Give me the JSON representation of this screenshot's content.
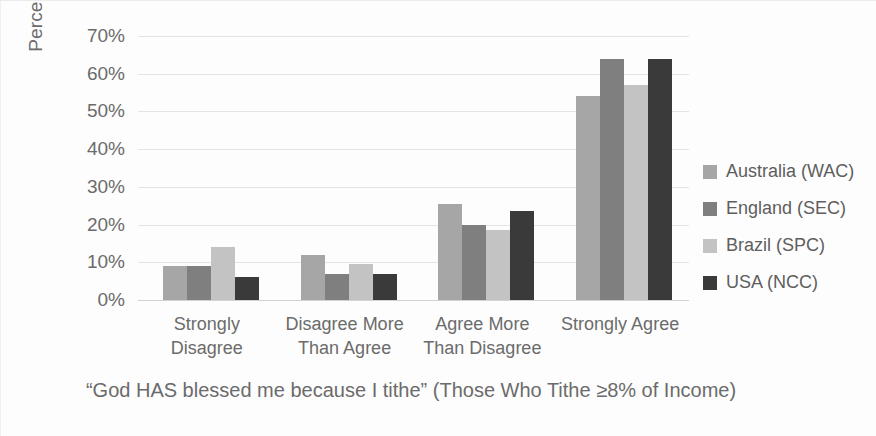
{
  "chart_data": {
    "type": "bar",
    "title": "“God HAS blessed me because I tithe” (Those Who Tithe ≥8% of Income)",
    "xlabel": "",
    "ylabel": "Percent of Respodents",
    "categories": [
      "Strongly\nDisagree",
      "Disagree More\nThan Agree",
      "Agree More\nThan Disagree",
      "Strongly Agree"
    ],
    "series": [
      {
        "name": "Australia (WAC)",
        "color": "#a6a6a6",
        "values": [
          9,
          12,
          25.5,
          54
        ]
      },
      {
        "name": "England (SEC)",
        "color": "#7f7f7f",
        "values": [
          9,
          7,
          20,
          64
        ]
      },
      {
        "name": "Brazil (SPC)",
        "color": "#c3c3c3",
        "values": [
          14,
          9.5,
          18.5,
          57
        ]
      },
      {
        "name": "USA (NCC)",
        "color": "#3a3a3a",
        "values": [
          6,
          7,
          23.5,
          64
        ]
      }
    ],
    "ylim": [
      0,
      70
    ],
    "ytick_labels": [
      "70%",
      "60%",
      "50%",
      "40%",
      "30%",
      "20%",
      "10%",
      "0%"
    ],
    "ytick_values": [
      70,
      60,
      50,
      40,
      30,
      20,
      10,
      0
    ],
    "grid": true,
    "legend_position": "right",
    "value_suffix": "%"
  }
}
